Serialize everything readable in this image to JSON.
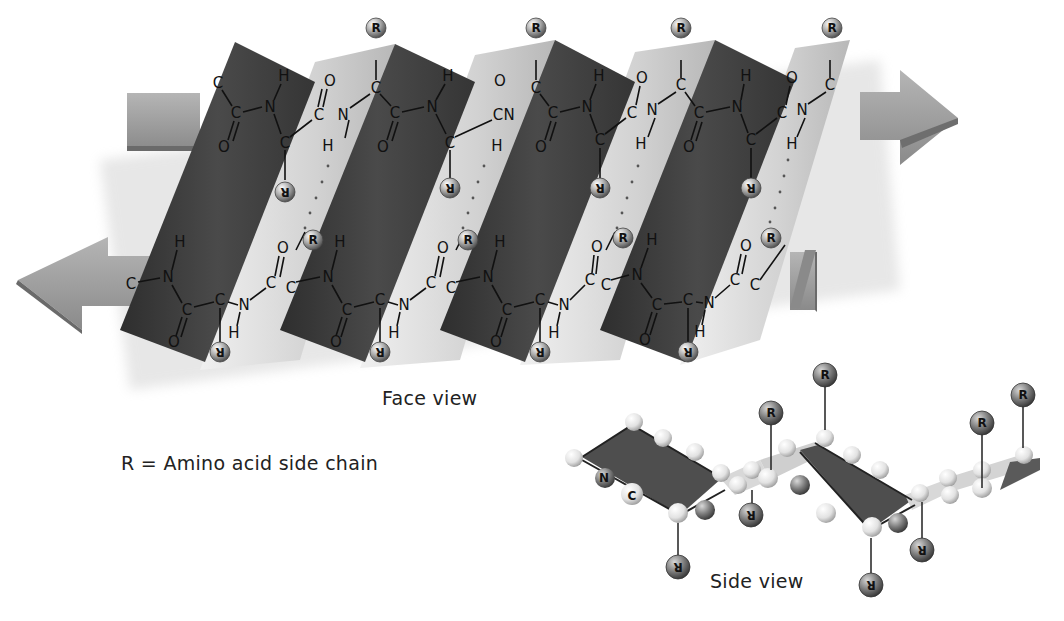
{
  "figure": {
    "face_view": {
      "caption": "Face view",
      "top_strand_direction": "right",
      "bottom_strand_direction": "left",
      "atoms": {
        "carbon": "C",
        "nitrogen": "N",
        "oxygen": "O",
        "hydrogen": "H"
      },
      "side_chain_label": "R",
      "colors": {
        "dark_pleat": "#3c3c3c",
        "light_pleat": "#d8d8d8",
        "arrow": "#9a9a9a",
        "r_ball": "#9c9c9c"
      }
    },
    "side_view": {
      "caption": "Side view",
      "labels": {
        "nitrogen": "N",
        "carbon": "C",
        "side_chain": "R"
      },
      "colors": {
        "plane": "#555555",
        "atom_ball": "#e6e6e6",
        "r_ball": "#7a7a7a"
      }
    },
    "legend": {
      "text": "R = Amino acid side chain"
    }
  }
}
